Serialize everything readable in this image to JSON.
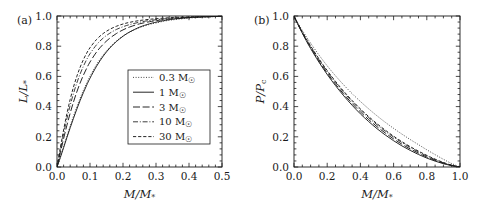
{
  "figure": {
    "background": "#ffffff",
    "line_color": "#1a1a1a",
    "text_color": "#1a1a1a"
  },
  "chart_data": [
    {
      "type": "line",
      "panel_label": "(a)",
      "title": "",
      "xlabel": "M/M_*",
      "ylabel": "L/L_*",
      "xlabel_parts": {
        "num": "M",
        "den": "M",
        "den_sub": "*"
      },
      "ylabel_parts": {
        "num": "L",
        "den": "L",
        "den_sub": "*"
      },
      "xlim": [
        0.0,
        0.5
      ],
      "ylim": [
        0.0,
        1.0
      ],
      "xticks": [
        0.0,
        0.1,
        0.2,
        0.3,
        0.4,
        0.5
      ],
      "xticklabels": [
        "0.0",
        "0.1",
        "0.2",
        "0.3",
        "0.4",
        "0.5"
      ],
      "yticks": [
        0.0,
        0.2,
        0.4,
        0.6,
        0.8,
        1.0
      ],
      "yticklabels": [
        "0.0",
        "0.2",
        "0.4",
        "0.6",
        "0.8",
        "1.0"
      ],
      "xminor_count": 5,
      "yminor_count": 5,
      "grid": false,
      "ticks_direction": "in",
      "legend_position": "lower right",
      "series": [
        {
          "name": "0.3 M_sun",
          "style": "dotted",
          "x": [
            0.0,
            0.01,
            0.02,
            0.03,
            0.04,
            0.05,
            0.06,
            0.07,
            0.08,
            0.09,
            0.1,
            0.12,
            0.14,
            0.16,
            0.18,
            0.2,
            0.22,
            0.25,
            0.28,
            0.3,
            0.33,
            0.36,
            0.4,
            0.44,
            0.47,
            0.5
          ],
          "y": [
            0.0,
            0.065,
            0.135,
            0.205,
            0.272,
            0.337,
            0.398,
            0.455,
            0.508,
            0.556,
            0.601,
            0.679,
            0.742,
            0.793,
            0.834,
            0.867,
            0.893,
            0.923,
            0.944,
            0.954,
            0.968,
            0.977,
            0.986,
            0.992,
            0.995,
            0.998
          ]
        },
        {
          "name": "1 M_sun",
          "style": "solid",
          "x": [
            0.0,
            0.01,
            0.02,
            0.03,
            0.04,
            0.05,
            0.06,
            0.07,
            0.08,
            0.09,
            0.1,
            0.12,
            0.14,
            0.16,
            0.18,
            0.2,
            0.22,
            0.25,
            0.28,
            0.3,
            0.33,
            0.36,
            0.4,
            0.44,
            0.47,
            0.5
          ],
          "y": [
            0.0,
            0.062,
            0.128,
            0.195,
            0.26,
            0.323,
            0.383,
            0.44,
            0.493,
            0.542,
            0.588,
            0.668,
            0.734,
            0.788,
            0.831,
            0.866,
            0.894,
            0.926,
            0.948,
            0.959,
            0.972,
            0.981,
            0.989,
            0.994,
            0.996,
            0.999
          ]
        },
        {
          "name": "3 M_sun",
          "style": "dashed-long",
          "x": [
            0.0,
            0.01,
            0.02,
            0.03,
            0.04,
            0.05,
            0.06,
            0.07,
            0.08,
            0.09,
            0.1,
            0.12,
            0.14,
            0.16,
            0.18,
            0.2,
            0.22,
            0.25,
            0.28,
            0.3,
            0.33,
            0.36,
            0.4,
            0.44,
            0.47,
            0.5
          ],
          "y": [
            0.0,
            0.094,
            0.188,
            0.276,
            0.357,
            0.431,
            0.497,
            0.556,
            0.608,
            0.654,
            0.695,
            0.762,
            0.813,
            0.853,
            0.884,
            0.908,
            0.927,
            0.948,
            0.962,
            0.969,
            0.978,
            0.984,
            0.99,
            0.994,
            0.996,
            0.999
          ]
        },
        {
          "name": "10 M_sun",
          "style": "dashdot",
          "x": [
            0.0,
            0.01,
            0.02,
            0.03,
            0.04,
            0.05,
            0.06,
            0.07,
            0.08,
            0.09,
            0.1,
            0.12,
            0.14,
            0.16,
            0.18,
            0.2,
            0.22,
            0.25,
            0.28,
            0.3,
            0.33,
            0.36,
            0.4,
            0.44,
            0.47,
            0.5
          ],
          "y": [
            0.0,
            0.112,
            0.221,
            0.32,
            0.409,
            0.487,
            0.556,
            0.616,
            0.667,
            0.712,
            0.75,
            0.81,
            0.854,
            0.886,
            0.911,
            0.929,
            0.943,
            0.959,
            0.97,
            0.975,
            0.982,
            0.987,
            0.992,
            0.995,
            0.997,
            0.999
          ]
        },
        {
          "name": "30 M_sun",
          "style": "dashed-short",
          "x": [
            0.0,
            0.01,
            0.02,
            0.03,
            0.04,
            0.05,
            0.06,
            0.07,
            0.08,
            0.09,
            0.1,
            0.12,
            0.14,
            0.16,
            0.18,
            0.2,
            0.22,
            0.25,
            0.28,
            0.3,
            0.33,
            0.36,
            0.4,
            0.44,
            0.47,
            0.5
          ],
          "y": [
            0.0,
            0.125,
            0.245,
            0.353,
            0.448,
            0.53,
            0.6,
            0.66,
            0.711,
            0.754,
            0.79,
            0.845,
            0.884,
            0.912,
            0.932,
            0.947,
            0.958,
            0.97,
            0.978,
            0.982,
            0.987,
            0.991,
            0.994,
            0.997,
            0.998,
            0.999
          ]
        }
      ],
      "legend": {
        "entries": [
          {
            "label_value": "0.3",
            "label_unit": "M",
            "label_sub": "☉",
            "style": "dotted"
          },
          {
            "label_value": "1",
            "label_unit": "M",
            "label_sub": "☉",
            "style": "solid"
          },
          {
            "label_value": "3",
            "label_unit": "M",
            "label_sub": "☉",
            "style": "dashed-long"
          },
          {
            "label_value": "10",
            "label_unit": "M",
            "label_sub": "☉",
            "style": "dashdot"
          },
          {
            "label_value": "30",
            "label_unit": "M",
            "label_sub": "☉",
            "style": "dashed-short"
          }
        ]
      }
    },
    {
      "type": "line",
      "panel_label": "(b)",
      "title": "",
      "xlabel": "M/M_*",
      "ylabel": "P/P_c",
      "xlabel_parts": {
        "num": "M",
        "den": "M",
        "den_sub": "*"
      },
      "ylabel_parts": {
        "num": "P",
        "den": "P",
        "den_sub": "c"
      },
      "xlim": [
        0.0,
        1.0
      ],
      "ylim": [
        0.0,
        1.0
      ],
      "xticks": [
        0.0,
        0.2,
        0.4,
        0.6,
        0.8,
        1.0
      ],
      "xticklabels": [
        "0.0",
        "0.2",
        "0.4",
        "0.6",
        "0.8",
        "1.0"
      ],
      "yticks": [
        0.0,
        0.2,
        0.4,
        0.6,
        0.8,
        1.0
      ],
      "yticklabels": [
        "0.0",
        "0.2",
        "0.4",
        "0.6",
        "0.8",
        "1.0"
      ],
      "xminor_count": 4,
      "yminor_count": 5,
      "grid": false,
      "ticks_direction": "in",
      "legend_position": "none",
      "series": [
        {
          "name": "0.3 M_sun",
          "style": "dotted",
          "x": [
            0.0,
            0.02,
            0.05,
            0.08,
            0.1,
            0.15,
            0.2,
            0.25,
            0.3,
            0.35,
            0.4,
            0.45,
            0.5,
            0.55,
            0.6,
            0.65,
            0.7,
            0.75,
            0.8,
            0.85,
            0.9,
            0.95,
            1.0
          ],
          "y": [
            1.0,
            0.96,
            0.905,
            0.853,
            0.82,
            0.742,
            0.67,
            0.604,
            0.543,
            0.486,
            0.434,
            0.385,
            0.339,
            0.296,
            0.256,
            0.218,
            0.182,
            0.148,
            0.114,
            0.082,
            0.051,
            0.023,
            0.0
          ]
        },
        {
          "name": "1 M_sun",
          "style": "solid",
          "x": [
            0.0,
            0.02,
            0.05,
            0.08,
            0.1,
            0.15,
            0.2,
            0.25,
            0.3,
            0.35,
            0.4,
            0.45,
            0.5,
            0.55,
            0.6,
            0.65,
            0.7,
            0.75,
            0.8,
            0.85,
            0.9,
            0.95,
            1.0
          ],
          "y": [
            1.0,
            0.952,
            0.886,
            0.824,
            0.785,
            0.695,
            0.613,
            0.539,
            0.471,
            0.409,
            0.352,
            0.301,
            0.254,
            0.212,
            0.174,
            0.14,
            0.11,
            0.083,
            0.059,
            0.039,
            0.022,
            0.009,
            0.0
          ]
        },
        {
          "name": "3 M_sun",
          "style": "dashed-long",
          "x": [
            0.0,
            0.02,
            0.05,
            0.08,
            0.1,
            0.15,
            0.2,
            0.25,
            0.3,
            0.35,
            0.4,
            0.45,
            0.5,
            0.55,
            0.6,
            0.65,
            0.7,
            0.75,
            0.8,
            0.85,
            0.9,
            0.95,
            1.0
          ],
          "y": [
            1.0,
            0.953,
            0.889,
            0.829,
            0.791,
            0.703,
            0.622,
            0.549,
            0.482,
            0.421,
            0.365,
            0.314,
            0.267,
            0.225,
            0.186,
            0.151,
            0.12,
            0.092,
            0.066,
            0.044,
            0.025,
            0.01,
            0.0
          ]
        },
        {
          "name": "10 M_sun",
          "style": "dashdot",
          "x": [
            0.0,
            0.02,
            0.05,
            0.08,
            0.1,
            0.15,
            0.2,
            0.25,
            0.3,
            0.35,
            0.4,
            0.45,
            0.5,
            0.55,
            0.6,
            0.65,
            0.7,
            0.75,
            0.8,
            0.85,
            0.9,
            0.95,
            1.0
          ],
          "y": [
            1.0,
            0.955,
            0.893,
            0.835,
            0.798,
            0.712,
            0.633,
            0.561,
            0.494,
            0.434,
            0.378,
            0.327,
            0.28,
            0.237,
            0.198,
            0.162,
            0.13,
            0.1,
            0.073,
            0.049,
            0.028,
            0.011,
            0.0
          ]
        },
        {
          "name": "30 M_sun",
          "style": "dashed-short",
          "x": [
            0.0,
            0.02,
            0.05,
            0.08,
            0.1,
            0.15,
            0.2,
            0.25,
            0.3,
            0.35,
            0.4,
            0.45,
            0.5,
            0.55,
            0.6,
            0.65,
            0.7,
            0.75,
            0.8,
            0.85,
            0.9,
            0.95,
            1.0
          ],
          "y": [
            1.0,
            0.956,
            0.895,
            0.838,
            0.802,
            0.717,
            0.639,
            0.567,
            0.501,
            0.441,
            0.385,
            0.334,
            0.287,
            0.244,
            0.204,
            0.168,
            0.135,
            0.105,
            0.077,
            0.052,
            0.03,
            0.012,
            0.0
          ]
        }
      ]
    }
  ]
}
